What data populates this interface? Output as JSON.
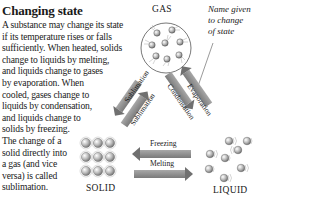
{
  "title": "Changing state",
  "body_lines": [
    "A substance may change its state",
    "if its temperature rises or falls",
    "sufficiently. When heated, solids",
    "change to liquids by melting,",
    "and liquids change to gases",
    "by evaporation. When",
    "cooled, gases change to",
    "liquids by condensation,",
    "and liquids change to",
    "solids by freezing.",
    "The change of a",
    "solid directly into",
    "a gas (and vice",
    "versa) is called",
    "sublimation."
  ],
  "states": {
    "gas": "GAS",
    "solid": "SOLID",
    "liquid": "LIQUID"
  },
  "annotation": [
    "Name given",
    "to change",
    "of state"
  ],
  "arrows": {
    "sublimation_down": "Sublimation",
    "sublimation_up": "Sublimation",
    "condensation": "Condensation",
    "evaporation": "Evaporation",
    "freezing": "Freezing",
    "melting": "Melting"
  },
  "colors": {
    "arrow_fill": "#8a8a8a",
    "arrow_dark": "#6a6a6a",
    "particle": "#9a9a9a",
    "text": "#1a1a1a"
  }
}
